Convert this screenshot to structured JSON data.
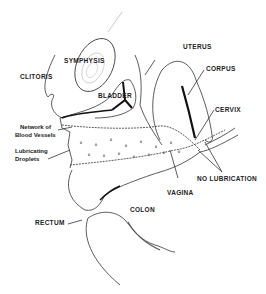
{
  "diagram": {
    "type": "anatomical-cross-section",
    "style": "black-and-white line drawing",
    "labels": {
      "symphysis": "SYMPHYSIS",
      "uterus": "UTERUS",
      "corpus": "CORPUS",
      "clitoris": "CLITORIS",
      "bladder": "BLADDER",
      "cervix": "CERVIX",
      "network_line1": "Network of",
      "network_line2": "Blood Vessels",
      "lubricating_line1": "Lubricating",
      "lubricating_line2": "Droplets",
      "no_lubrication": "NO LUBRICATION",
      "vagina": "VAGINA",
      "rectum": "RECTUM",
      "colon": "COLON"
    },
    "colors": {
      "ink": "#222222",
      "background": "#ffffff"
    }
  }
}
